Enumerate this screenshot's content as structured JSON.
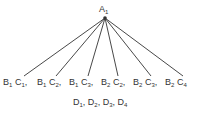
{
  "root": {
    "letter": "A",
    "sub": "1",
    "x": 105,
    "y": 18
  },
  "leaves": [
    {
      "parts": [
        [
          "B",
          "1"
        ],
        [
          "C",
          "1"
        ]
      ],
      "suffix": ",",
      "x": 24,
      "lx": 3
    },
    {
      "parts": [
        [
          "B",
          "1"
        ],
        [
          "C",
          "2"
        ]
      ],
      "suffix": ",",
      "x": 56,
      "lx": 37
    },
    {
      "parts": [
        [
          "B",
          "1"
        ],
        [
          "C",
          "3"
        ]
      ],
      "suffix": ",",
      "x": 88,
      "lx": 69
    },
    {
      "parts": [
        [
          "B",
          "2"
        ],
        [
          "C",
          "2"
        ]
      ],
      "suffix": ",",
      "x": 118,
      "lx": 101
    },
    {
      "parts": [
        [
          "B",
          "2"
        ],
        [
          "C",
          "3"
        ]
      ],
      "suffix": ",",
      "x": 151,
      "lx": 133
    },
    {
      "parts": [
        [
          "B",
          "2"
        ],
        [
          "C",
          "4"
        ]
      ],
      "suffix": "",
      "x": 183,
      "lx": 165
    }
  ],
  "leaf_line_end_y": 76,
  "footer": {
    "items": [
      [
        "D",
        "1"
      ],
      [
        "D",
        "2"
      ],
      [
        "D",
        "3"
      ],
      [
        "D",
        "4"
      ]
    ],
    "separator": ", "
  },
  "colors": {
    "line": "#333333",
    "text": "#333333"
  }
}
